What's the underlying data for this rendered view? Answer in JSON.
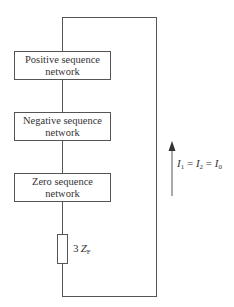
{
  "diagram": {
    "type": "sequence network connection (single line-to-ground fault)",
    "boxes": [
      {
        "id": "positive",
        "line1": "Positive sequence",
        "line2": "network"
      },
      {
        "id": "negative",
        "line1": "Negative sequence",
        "line2": "network"
      },
      {
        "id": "zero",
        "line1": "Zero sequence",
        "line2": "network"
      }
    ],
    "impedance": {
      "coef": "3",
      "symbol": "Z",
      "subscript": "F"
    },
    "current_label": {
      "parts": [
        {
          "sym": "I",
          "sub": "1"
        },
        {
          "op": " = "
        },
        {
          "sym": "I",
          "sub": "2"
        },
        {
          "op": " = "
        },
        {
          "sym": "I",
          "sub": "0"
        }
      ],
      "text": "I1 = I2 = I0"
    },
    "arrow_direction": "up",
    "colors": {
      "line": "#555555",
      "text": "#333333",
      "background": "#ffffff"
    }
  }
}
